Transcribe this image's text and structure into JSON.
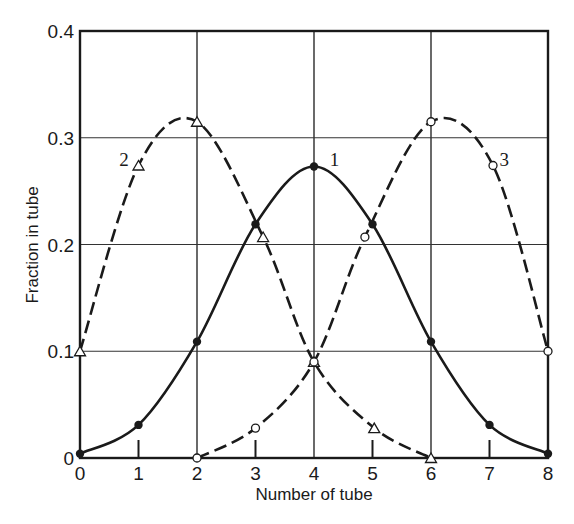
{
  "chart_data": {
    "type": "line",
    "title": "",
    "xlabel": "Number of tube",
    "ylabel": "Fraction in tube",
    "xlim": [
      0,
      8
    ],
    "ylim": [
      0,
      0.4
    ],
    "grid": true,
    "grid_x": [
      0,
      2,
      4,
      6,
      8
    ],
    "grid_y": [
      0,
      0.1,
      0.2,
      0.3,
      0.4
    ],
    "x_ticks": [
      0,
      1,
      2,
      3,
      4,
      5,
      6,
      7,
      8
    ],
    "x_tick_labels": [
      "0",
      "1",
      "2",
      "3",
      "4",
      "5",
      "6",
      "7",
      "8"
    ],
    "y_ticks": [
      0,
      0.1,
      0.2,
      0.3,
      0.4
    ],
    "y_tick_labels": [
      "0",
      "0.1",
      "0.2",
      "0.3",
      "0.4"
    ],
    "legend": "none (curves labeled inline)",
    "series": [
      {
        "name": "1",
        "style": "solid",
        "marker": "filled-circle",
        "x": [
          0,
          1,
          2,
          3,
          4,
          5,
          6,
          7,
          8
        ],
        "values": [
          0.004,
          0.031,
          0.109,
          0.219,
          0.273,
          0.219,
          0.109,
          0.031,
          0.004
        ],
        "label_at": [
          4.35,
          0.28
        ]
      },
      {
        "name": "2",
        "style": "dashed",
        "marker": "open-triangle",
        "x": [
          0,
          1,
          2,
          3.13,
          4,
          5.03,
          6
        ],
        "values": [
          0.1,
          0.274,
          0.315,
          0.207,
          0.09,
          0.028,
          0.0
        ],
        "label_at": [
          0.75,
          0.28
        ]
      },
      {
        "name": "3",
        "style": "dashed",
        "marker": "open-circle",
        "x": [
          2,
          3,
          4,
          4.87,
          6,
          7.06,
          8
        ],
        "values": [
          0.0,
          0.028,
          0.09,
          0.207,
          0.315,
          0.274,
          0.1
        ],
        "label_at": [
          7.25,
          0.28
        ]
      }
    ]
  }
}
